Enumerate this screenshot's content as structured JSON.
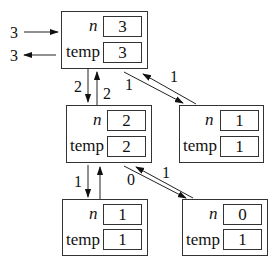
{
  "diagram": {
    "type": "recursion-call-stack",
    "frames": [
      {
        "id": "frame-n3",
        "n_label": "n",
        "temp_label": "temp",
        "n": "3",
        "temp": "3"
      },
      {
        "id": "frame-n2",
        "n_label": "n",
        "temp_label": "temp",
        "n": "2",
        "temp": "2"
      },
      {
        "id": "frame-n1-right",
        "n_label": "n",
        "temp_label": "temp",
        "n": "1",
        "temp": "1"
      },
      {
        "id": "frame-n1-bottom",
        "n_label": "n",
        "temp_label": "temp",
        "n": "1",
        "temp": "1"
      },
      {
        "id": "frame-n0",
        "n_label": "n",
        "temp_label": "temp",
        "n": "0",
        "temp": "1"
      }
    ],
    "edges": [
      {
        "from": "caller",
        "to": "frame-n3",
        "label": "3",
        "kind": "call"
      },
      {
        "from": "frame-n3",
        "to": "caller",
        "label": "3",
        "kind": "return"
      },
      {
        "from": "frame-n3",
        "to": "frame-n2",
        "label": "2",
        "kind": "call"
      },
      {
        "from": "frame-n2",
        "to": "frame-n3",
        "label": "2",
        "kind": "return"
      },
      {
        "from": "frame-n3",
        "to": "frame-n1-right",
        "label": "1",
        "kind": "call"
      },
      {
        "from": "frame-n1-right",
        "to": "frame-n3",
        "label": "1",
        "kind": "return"
      },
      {
        "from": "frame-n2",
        "to": "frame-n1-bottom",
        "label": "1",
        "kind": "call"
      },
      {
        "from": "frame-n1-bottom",
        "to": "frame-n2",
        "label": "",
        "kind": "return"
      },
      {
        "from": "frame-n2",
        "to": "frame-n0",
        "label": "0",
        "kind": "call"
      },
      {
        "from": "frame-n0",
        "to": "frame-n2",
        "label": "1",
        "kind": "return"
      }
    ]
  }
}
